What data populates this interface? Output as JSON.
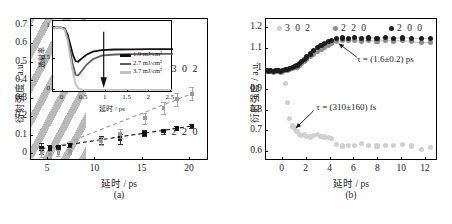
{
  "figure": {
    "panel_a_label": "(a)",
    "panel_b_label": "(b)"
  },
  "chart_data": [
    {
      "id": "panel_a",
      "type": "scatter",
      "title": "",
      "xlabel": "延时 / ps",
      "ylabel": "衍射强度 / a.u.",
      "xlim": [
        3.2,
        22.0
      ],
      "ylim": [
        -0.04,
        0.74
      ],
      "xticks": [
        5,
        10,
        15,
        20
      ],
      "yticks": [
        0,
        0.1,
        0.2,
        0.3,
        0.4,
        0.5,
        0.6,
        0.7
      ],
      "ytick_labels": [
        "0",
        "0.1",
        "0.2",
        "0.3",
        "0.4",
        "0.5",
        "0.6",
        "0.7"
      ],
      "xtick_labels": [
        "5",
        "10",
        "15",
        "20"
      ],
      "grid": false,
      "legend_position": "inline-right",
      "shaded_region": {
        "label": "diagonal-hatch",
        "x_from": 3.2,
        "x_to": 9.0,
        "color": "#b9b9b9"
      },
      "series": [
        {
          "name": "2 2 0",
          "color": "#111111",
          "marker": "square",
          "fit": "dashed",
          "x": [
            4.3,
            5.2,
            6.1,
            7.3,
            10.6,
            12.6,
            15.2,
            17.2,
            18.6,
            20.2
          ],
          "y": [
            0.028,
            0.03,
            0.038,
            0.048,
            0.074,
            0.082,
            0.112,
            0.124,
            0.14,
            0.152
          ],
          "yerr": [
            0.03,
            0.016,
            0.012,
            0.012,
            0.022,
            0.026,
            0.016,
            0.014,
            0.012,
            0.012
          ]
        },
        {
          "name": "3 0 2",
          "color": "#9a9a9a",
          "marker": "square",
          "fit": "dashed",
          "x": [
            4.3,
            5.2,
            6.1,
            7.3,
            10.6,
            12.6,
            15.2,
            17.2,
            18.6,
            20.2
          ],
          "y": [
            0.004,
            -0.004,
            0.004,
            0.01,
            0.07,
            0.11,
            0.195,
            0.25,
            0.3,
            0.33
          ],
          "yerr": [
            0.022,
            0.018,
            0.014,
            0.014,
            0.02,
            0.026,
            0.03,
            0.034,
            0.036,
            0.036
          ]
        }
      ],
      "series_annotations": [
        {
          "text": "3 0 2",
          "x": 19.2,
          "y": 0.46
        },
        {
          "text": "2 2 0",
          "x": 19.2,
          "y": 0.115
        }
      ],
      "inset": {
        "type": "line",
        "xlabel": "延时 / ps",
        "ylabel": "透射率",
        "xlim": [
          -0.22,
          2.55
        ],
        "ylim": [
          -0.05,
          1.1
        ],
        "xticks": [
          0,
          0.5,
          1,
          1.5,
          2,
          2.5
        ],
        "xtick_labels": [
          "0",
          "0.5",
          "1",
          "1.5",
          "2",
          "2.5"
        ],
        "yticks": [
          0,
          0.5,
          1
        ],
        "ytick_labels": [
          "0",
          "0.5",
          "1"
        ],
        "arrow_annotation": "downward-arrow",
        "series": [
          {
            "name": "1.9 mJ/cm²",
            "color": "#111111",
            "x": [
              -0.22,
              -0.05,
              0.05,
              0.12,
              0.18,
              0.24,
              0.3,
              0.36,
              0.44,
              0.55,
              0.7,
              0.9,
              1.2,
              1.6,
              2.0,
              2.55
            ],
            "y": [
              1.0,
              1.0,
              0.98,
              0.88,
              0.72,
              0.56,
              0.46,
              0.45,
              0.5,
              0.56,
              0.61,
              0.635,
              0.645,
              0.648,
              0.65,
              0.65
            ]
          },
          {
            "name": "2.7 mJ/cm²",
            "color": "#5e5e5e",
            "x": [
              -0.22,
              -0.05,
              0.05,
              0.12,
              0.18,
              0.24,
              0.3,
              0.36,
              0.44,
              0.55,
              0.7,
              0.9,
              1.2,
              1.6,
              2.0,
              2.55
            ],
            "y": [
              1.0,
              1.0,
              0.97,
              0.83,
              0.62,
              0.4,
              0.24,
              0.23,
              0.3,
              0.4,
              0.49,
              0.545,
              0.565,
              0.572,
              0.575,
              0.575
            ]
          },
          {
            "name": "3.7 mJ/cm²",
            "color": "#c2c2c2",
            "x": [
              -0.22,
              -0.05,
              0.05,
              0.12,
              0.18,
              0.24,
              0.3,
              0.36,
              0.44,
              0.55,
              0.7,
              0.9,
              1.2,
              1.6,
              2.0,
              2.55
            ],
            "y": [
              1.0,
              1.0,
              0.96,
              0.78,
              0.52,
              0.28,
              0.1,
              0.03,
              0.0,
              0.0,
              0.0,
              0.0,
              0.0,
              0.0,
              0.0,
              0.0
            ]
          }
        ]
      }
    },
    {
      "id": "panel_b",
      "type": "scatter",
      "title": "",
      "xlabel": "延时 / ps",
      "ylabel": "衍射强度 / a.u.",
      "xlim": [
        -1.4,
        13.0
      ],
      "ylim": [
        0.555,
        1.245
      ],
      "xticks": [
        0,
        2,
        4,
        6,
        8,
        10,
        12
      ],
      "xtick_labels": [
        "0",
        "2",
        "4",
        "6",
        "8",
        "10",
        "12"
      ],
      "yticks": [
        0.6,
        0.7,
        0.8,
        0.9,
        1.0,
        1.1,
        1.2
      ],
      "ytick_labels": [
        "0.6",
        "0.7",
        "0.8",
        "0.9",
        "1",
        "1.1",
        "1.2"
      ],
      "grid": false,
      "legend_position": "top",
      "legend": [
        {
          "name": "3 0 2",
          "color": "#cfcfcf"
        },
        {
          "name": "2 2 0",
          "color": "#8c8c8c"
        },
        {
          "name": "2 0 0",
          "color": "#1c1c1c"
        }
      ],
      "annotations": [
        {
          "text": "τ = (1.6±0.2) ps",
          "target_x": 4.7,
          "target_y": 1.125
        },
        {
          "text": "τ = (310±160) fs",
          "target_x": 1.1,
          "target_y": 0.715
        }
      ],
      "series": [
        {
          "name": "2 0 0",
          "color": "#1c1c1c",
          "marker": "circle",
          "x": [
            -1.2,
            -1.0,
            -0.8,
            -0.6,
            -0.4,
            -0.2,
            0.0,
            0.2,
            0.4,
            0.6,
            0.8,
            1.0,
            1.2,
            1.4,
            1.6,
            1.8,
            2.0,
            2.3,
            2.6,
            2.9,
            3.2,
            3.5,
            3.8,
            4.1,
            4.5,
            5.0,
            5.5,
            6.0,
            6.6,
            7.2,
            7.9,
            8.6,
            9.3,
            10.0,
            10.8,
            11.6,
            12.4
          ],
          "y": [
            0.992,
            0.995,
            0.99,
            0.993,
            0.996,
            0.99,
            0.995,
            1.0,
            1.0,
            1.005,
            1.01,
            1.015,
            1.02,
            1.03,
            1.04,
            1.05,
            1.06,
            1.075,
            1.09,
            1.105,
            1.115,
            1.125,
            1.135,
            1.142,
            1.15,
            1.153,
            1.152,
            1.154,
            1.152,
            1.153,
            1.152,
            1.154,
            1.152,
            1.153,
            1.152,
            1.15,
            1.152
          ]
        },
        {
          "name": "2 2 0",
          "color": "#8c8c8c",
          "marker": "circle",
          "x": [
            -1.2,
            -1.0,
            -0.8,
            -0.6,
            -0.4,
            -0.2,
            0.0,
            0.2,
            0.4,
            0.6,
            0.8,
            1.0,
            1.2,
            1.4,
            1.6,
            1.8,
            2.0,
            2.3,
            2.6,
            2.9,
            3.2,
            3.5,
            3.8,
            4.1,
            4.5,
            5.0,
            5.5,
            6.0,
            6.6,
            7.2,
            7.9,
            8.6,
            9.3,
            10.0,
            10.8,
            11.6,
            12.4
          ],
          "y": [
            0.988,
            0.99,
            0.986,
            0.99,
            0.992,
            0.987,
            0.99,
            0.995,
            0.996,
            1.0,
            1.003,
            1.008,
            1.012,
            1.02,
            1.03,
            1.04,
            1.05,
            1.062,
            1.075,
            1.088,
            1.098,
            1.108,
            1.118,
            1.125,
            1.135,
            1.14,
            1.139,
            1.14,
            1.138,
            1.14,
            1.138,
            1.14,
            1.138,
            1.14,
            1.135,
            1.13,
            1.132
          ]
        },
        {
          "name": "3 0 2",
          "color": "#cfcfcf",
          "marker": "circle",
          "x": [
            -1.2,
            -1.0,
            -0.8,
            -0.6,
            -0.4,
            -0.2,
            0.0,
            0.2,
            0.4,
            0.6,
            0.8,
            1.0,
            1.2,
            1.4,
            1.6,
            1.8,
            2.0,
            2.3,
            2.6,
            2.9,
            3.2,
            3.5,
            3.8,
            4.1,
            4.5,
            5.0,
            5.5,
            6.0,
            6.6,
            7.2,
            7.9,
            8.6,
            9.3,
            10.0,
            10.8,
            11.6,
            12.4
          ],
          "y": [
            0.99,
            0.995,
            0.99,
            0.992,
            0.988,
            0.99,
            0.985,
            0.93,
            0.84,
            0.76,
            0.725,
            0.715,
            0.7,
            0.685,
            0.678,
            0.682,
            0.675,
            0.672,
            0.678,
            0.682,
            0.675,
            0.672,
            0.668,
            0.665,
            0.635,
            0.628,
            0.632,
            0.63,
            0.64,
            0.632,
            0.628,
            0.632,
            0.63,
            0.635,
            0.628,
            0.61,
            0.62
          ]
        }
      ]
    }
  ]
}
